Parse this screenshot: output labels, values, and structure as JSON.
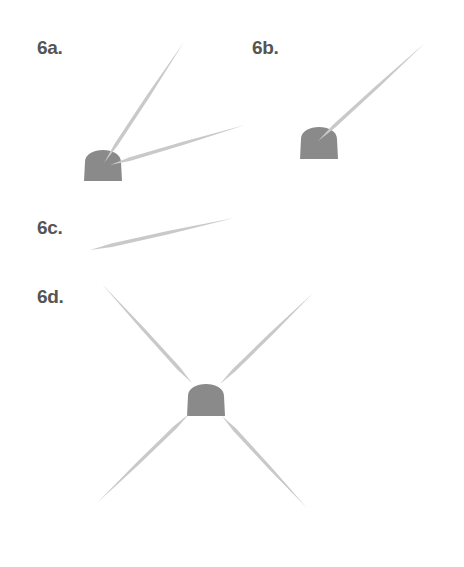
{
  "figures": [
    {
      "id": "6a",
      "label": "6a.",
      "label_pos": [
        37,
        38
      ],
      "dome": {
        "x": 84,
        "y": 144,
        "w": 38,
        "h": 37
      },
      "needles": [
        {
          "x1": 104,
          "y1": 163,
          "x2": 184,
          "y2": 42
        },
        {
          "x1": 110,
          "y1": 165,
          "x2": 245,
          "y2": 125
        }
      ]
    },
    {
      "id": "6b",
      "label": "6b.",
      "label_pos": [
        252,
        38
      ],
      "dome": {
        "x": 300,
        "y": 121,
        "w": 38,
        "h": 38
      },
      "needles": [
        {
          "x1": 318,
          "y1": 141,
          "x2": 425,
          "y2": 43
        }
      ]
    },
    {
      "id": "6c",
      "label": "6c.",
      "label_pos": [
        37,
        218
      ],
      "dome": null,
      "needles": [
        {
          "x1": 90,
          "y1": 250,
          "x2": 234,
          "y2": 218
        }
      ]
    },
    {
      "id": "6d",
      "label": "6d.",
      "label_pos": [
        37,
        287
      ],
      "dome": {
        "x": 187,
        "y": 378,
        "w": 38,
        "h": 38
      },
      "needles": [
        {
          "x1": 192,
          "y1": 383,
          "x2": 102,
          "y2": 284
        },
        {
          "x1": 220,
          "y1": 384,
          "x2": 313,
          "y2": 293
        },
        {
          "x1": 189,
          "y1": 414,
          "x2": 97,
          "y2": 503
        },
        {
          "x1": 222,
          "y1": 416,
          "x2": 307,
          "y2": 508
        }
      ]
    }
  ],
  "colors": {
    "dome": "#8a8a8a",
    "needle": "#c9c9c9",
    "label": "#555555",
    "background": "#ffffff"
  }
}
